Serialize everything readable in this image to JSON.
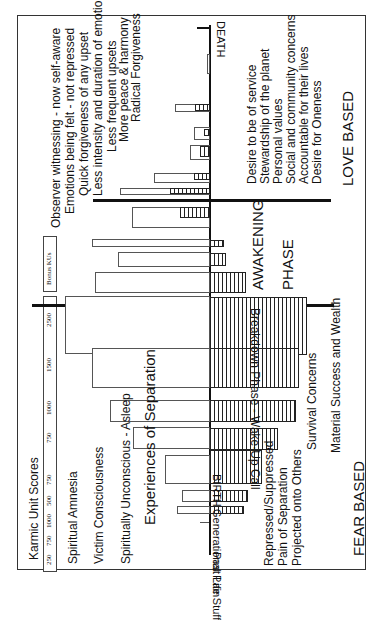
{
  "orientation": "rotated-90-ccw",
  "scale": {
    "title": "Karmic Unit Scores",
    "ticks": [
      "250",
      "750",
      "1000",
      "500",
      "750",
      "750",
      "1000",
      "1500",
      "2500"
    ],
    "bonus_label": "Bonus KUs"
  },
  "timeline": {
    "start_label": "BIRTH",
    "end_label": "DEATH",
    "pre_birth": [
      "Past Life Stuff",
      "Generational Pain"
    ]
  },
  "phases": {
    "breakdown": "Breakdown Phase - Wake-Up Call",
    "awakening_1": "AWAKENING",
    "awakening_2": "PHASE",
    "separation": "Experiences of Separation"
  },
  "fear_side": {
    "consciousness": [
      "Spiritual Amnesia",
      "Victim Consciousness",
      "Spiritually Unconscious - Asleep"
    ],
    "emotions": [
      "Repressed/Suppressed",
      "Pain of Separation",
      "Projected onto Others"
    ],
    "concerns": [
      "Survival Concerns",
      "Material Success and Wealth"
    ],
    "label": "FEAR BASED"
  },
  "love_side": {
    "emotions": [
      "Observer witnessing - now self-aware",
      "Emotions being felt - not repressed",
      "Quick forgiveness of any upset",
      "Less intensity and duration of emotion",
      "Less frequent upsets",
      "More peace & harmony",
      "Radical Forgiveness"
    ],
    "values": [
      "Desire to be of service",
      "Stewardship of the planet",
      "Personal values",
      "Social and community concerns",
      "Accountable for their lives",
      "Desire for Oneness"
    ],
    "label": "LOVE BASED"
  }
}
